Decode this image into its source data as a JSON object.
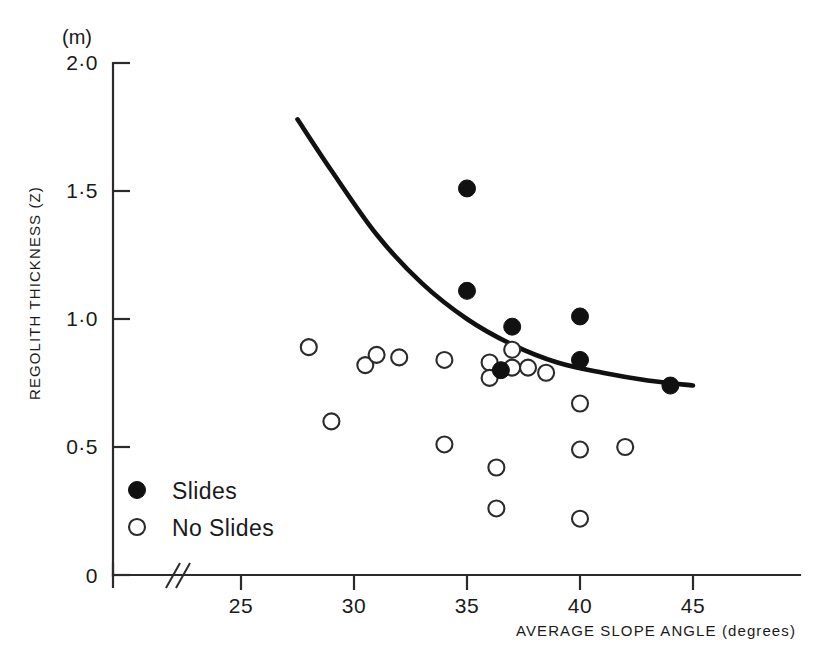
{
  "chart_data": {
    "type": "scatter",
    "title": "",
    "xlabel": "AVERAGE SLOPE ANGLE (degrees)",
    "ylabel": "REGOLITH THICKNESS (Z)",
    "yunit": "(m)",
    "xlim": [
      22.5,
      45.5
    ],
    "ylim": [
      0,
      2.0
    ],
    "x_ticks": [
      25,
      30,
      35,
      40,
      45
    ],
    "x_tick_labels": [
      "25",
      "30",
      "35",
      "40",
      "45"
    ],
    "y_ticks": [
      0,
      0.5,
      1.0,
      1.5,
      2.0
    ],
    "y_tick_labels": [
      "0",
      "0·5",
      "1·0",
      "1·5",
      "2·0"
    ],
    "grid": false,
    "axis_break": {
      "present": true,
      "glyph": "//",
      "x_position": 23.2
    },
    "legend_position": "lower-left",
    "series": [
      {
        "name": "Slides",
        "marker": "filled-circle",
        "color": "#111111",
        "points": [
          {
            "x": 35.0,
            "y": 1.51
          },
          {
            "x": 35.0,
            "y": 1.11
          },
          {
            "x": 36.5,
            "y": 0.8
          },
          {
            "x": 37.0,
            "y": 0.97
          },
          {
            "x": 40.0,
            "y": 1.01
          },
          {
            "x": 40.0,
            "y": 0.84
          },
          {
            "x": 44.0,
            "y": 0.74
          }
        ]
      },
      {
        "name": "No Slides",
        "marker": "open-circle",
        "color": "#2b2b2b",
        "points": [
          {
            "x": 28.0,
            "y": 0.89
          },
          {
            "x": 29.0,
            "y": 0.6
          },
          {
            "x": 30.5,
            "y": 0.82
          },
          {
            "x": 31.0,
            "y": 0.86
          },
          {
            "x": 32.0,
            "y": 0.85
          },
          {
            "x": 34.0,
            "y": 0.84
          },
          {
            "x": 34.0,
            "y": 0.51
          },
          {
            "x": 36.0,
            "y": 0.83
          },
          {
            "x": 36.0,
            "y": 0.77
          },
          {
            "x": 36.3,
            "y": 0.42
          },
          {
            "x": 36.3,
            "y": 0.26
          },
          {
            "x": 37.0,
            "y": 0.88
          },
          {
            "x": 37.0,
            "y": 0.81
          },
          {
            "x": 37.7,
            "y": 0.81
          },
          {
            "x": 38.5,
            "y": 0.79
          },
          {
            "x": 40.0,
            "y": 0.67
          },
          {
            "x": 40.0,
            "y": 0.49
          },
          {
            "x": 40.0,
            "y": 0.22
          },
          {
            "x": 42.0,
            "y": 0.5
          }
        ]
      }
    ],
    "trend_curve": {
      "name": "threshold curve",
      "color": "#111111",
      "points": [
        {
          "x": 27.5,
          "y": 1.78
        },
        {
          "x": 29.0,
          "y": 1.58
        },
        {
          "x": 31.0,
          "y": 1.33
        },
        {
          "x": 33.0,
          "y": 1.14
        },
        {
          "x": 35.0,
          "y": 1.0
        },
        {
          "x": 37.0,
          "y": 0.9
        },
        {
          "x": 39.0,
          "y": 0.83
        },
        {
          "x": 41.0,
          "y": 0.79
        },
        {
          "x": 43.0,
          "y": 0.76
        },
        {
          "x": 45.0,
          "y": 0.74
        }
      ]
    }
  },
  "legend": {
    "entries": [
      {
        "label": "Slides",
        "marker": "filled-circle"
      },
      {
        "label": "No Slides",
        "marker": "open-circle"
      }
    ]
  }
}
